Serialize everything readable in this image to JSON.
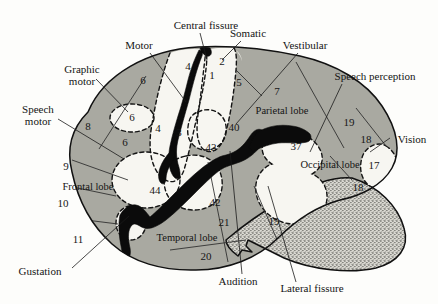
{
  "figure": {
    "background_color": "#fdfdfb",
    "cortex_color": "#a9a9a1",
    "sulcus_color": "#f7f6f1",
    "fissure_color": "#0b0b0b",
    "cerebellum_texture": "stipple"
  },
  "callouts": [
    {
      "id": "central-fissure",
      "label": "Central fissure",
      "x": 206,
      "y": 26,
      "anchor": "middle"
    },
    {
      "id": "motor",
      "label": "Motor",
      "x": 139,
      "y": 46,
      "anchor": "middle"
    },
    {
      "id": "somatic",
      "label": "Somatic",
      "x": 248,
      "y": 34,
      "anchor": "middle"
    },
    {
      "id": "vestibular",
      "label": "Vestibular",
      "x": 305,
      "y": 46,
      "anchor": "middle"
    },
    {
      "id": "graphic-motor",
      "label": "Graphic",
      "x": 82,
      "y": 70,
      "anchor": "middle"
    },
    {
      "id": "graphic-motor-2",
      "label": "motor",
      "x": 82,
      "y": 82,
      "anchor": "middle"
    },
    {
      "id": "speech-perception",
      "label": "Speech perception",
      "x": 375,
      "y": 77,
      "anchor": "middle"
    },
    {
      "id": "speech-motor",
      "label": "Speech",
      "x": 38,
      "y": 110,
      "anchor": "middle"
    },
    {
      "id": "speech-motor-2",
      "label": "motor",
      "x": 38,
      "y": 122,
      "anchor": "middle"
    },
    {
      "id": "vision",
      "label": "Vision",
      "x": 412,
      "y": 140,
      "anchor": "middle"
    },
    {
      "id": "gustation",
      "label": "Gustation",
      "x": 40,
      "y": 272,
      "anchor": "middle"
    },
    {
      "id": "audition",
      "label": "Audition",
      "x": 238,
      "y": 282,
      "anchor": "middle"
    },
    {
      "id": "lateral-fissure",
      "label": "Lateral fissure",
      "x": 312,
      "y": 289,
      "anchor": "middle"
    }
  ],
  "lobes": [
    {
      "id": "parietal-lobe",
      "label": "Parietal lobe",
      "x": 282,
      "y": 112
    },
    {
      "id": "frontal-lobe",
      "label": "Frontal lobe",
      "x": 88,
      "y": 188
    },
    {
      "id": "temporal-lobe",
      "label": "Temporal lobe",
      "x": 187,
      "y": 239
    },
    {
      "id": "occipital-lobe",
      "label": "Occipital lobe",
      "x": 330,
      "y": 166
    }
  ],
  "brodmann_areas": [
    {
      "id": "area-6-top",
      "number": "6",
      "x": 143,
      "y": 81
    },
    {
      "id": "area-4-top",
      "number": "4",
      "x": 188,
      "y": 67
    },
    {
      "id": "area-1",
      "number": "1",
      "x": 212,
      "y": 76
    },
    {
      "id": "area-2",
      "number": "2",
      "x": 222,
      "y": 62
    },
    {
      "id": "area-5",
      "number": "5",
      "x": 239,
      "y": 83
    },
    {
      "id": "area-7",
      "number": "7",
      "x": 277,
      "y": 92
    },
    {
      "id": "area-6-circle",
      "number": "6",
      "x": 132,
      "y": 118
    },
    {
      "id": "area-8",
      "number": "8",
      "x": 88,
      "y": 127
    },
    {
      "id": "area-6-lower",
      "number": "6",
      "x": 125,
      "y": 143
    },
    {
      "id": "area-4-mid",
      "number": "4",
      "x": 158,
      "y": 129
    },
    {
      "id": "area-3",
      "number": "3",
      "x": 179,
      "y": 133
    },
    {
      "id": "area-40",
      "number": "40",
      "x": 234,
      "y": 128
    },
    {
      "id": "area-19-upper",
      "number": "19",
      "x": 349,
      "y": 123
    },
    {
      "id": "area-18-upper",
      "number": "18",
      "x": 366,
      "y": 140
    },
    {
      "id": "area-43",
      "number": "43",
      "x": 211,
      "y": 148
    },
    {
      "id": "area-37",
      "number": "37",
      "x": 296,
      "y": 147
    },
    {
      "id": "area-17",
      "number": "17",
      "x": 374,
      "y": 166
    },
    {
      "id": "area-9",
      "number": "9",
      "x": 66,
      "y": 167
    },
    {
      "id": "area-18-lower",
      "number": "18",
      "x": 358,
      "y": 188
    },
    {
      "id": "area-44",
      "number": "44",
      "x": 155,
      "y": 191
    },
    {
      "id": "area-10",
      "number": "10",
      "x": 63,
      "y": 204
    },
    {
      "id": "area-42",
      "number": "42",
      "x": 215,
      "y": 203
    },
    {
      "id": "area-21",
      "number": "21",
      "x": 224,
      "y": 223
    },
    {
      "id": "area-19-lower",
      "number": "19",
      "x": 274,
      "y": 222
    },
    {
      "id": "area-11",
      "number": "11",
      "x": 78,
      "y": 240
    },
    {
      "id": "area-20",
      "number": "20",
      "x": 206,
      "y": 257
    }
  ]
}
